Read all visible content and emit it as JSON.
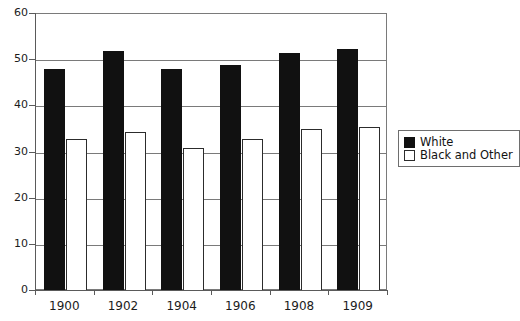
{
  "chart_data": {
    "type": "bar",
    "title": "",
    "subtitle": "",
    "xlabel": "",
    "ylabel": "",
    "categories": [
      "1900",
      "1902",
      "1904",
      "1906",
      "1908",
      "1909"
    ],
    "series": [
      {
        "name": "White",
        "color": "#111111",
        "values": [
          48,
          52,
          48,
          49,
          51.5,
          52.5
        ]
      },
      {
        "name": "Black and Other",
        "color": "#ffffff",
        "values": [
          33,
          34.5,
          31,
          33,
          35,
          35.5
        ]
      }
    ],
    "ylim": [
      0,
      60
    ],
    "yticks": [
      0,
      10,
      20,
      30,
      40,
      50,
      60
    ],
    "ytick_labels": [
      "0",
      "10",
      "20",
      "30",
      "40",
      "50",
      "60"
    ],
    "grid": "horizontal",
    "legend_position": "right"
  },
  "legend": {
    "entries": [
      {
        "label": "White",
        "swatch": "filled-black-square"
      },
      {
        "label": "Black and Other",
        "swatch": "outlined-white-square"
      }
    ]
  }
}
